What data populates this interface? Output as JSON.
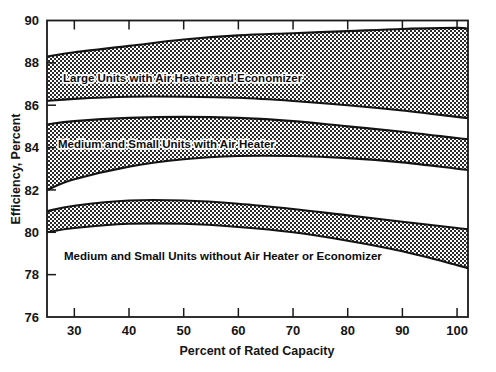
{
  "chart_data": {
    "type": "area",
    "title": "",
    "subtitle": "",
    "xlabel": "Percent of Rated Capacity",
    "ylabel": "Efficiency, Percent",
    "xlim": [
      25,
      102
    ],
    "ylim": [
      76,
      90
    ],
    "xticks": [
      30,
      40,
      50,
      60,
      70,
      80,
      90,
      100
    ],
    "yticks": [
      76,
      78,
      80,
      82,
      84,
      86,
      88,
      90
    ],
    "grid": false,
    "legend_position": "inline-annotations",
    "bands": [
      {
        "name": "Large Units with Air Heater and Economizer",
        "label": "Large Units with Air Heater and Economizer",
        "fill": "stipple-dotted",
        "x": [
          25,
          30,
          40,
          50,
          60,
          70,
          80,
          90,
          100,
          102
        ],
        "upper": [
          88.3,
          88.5,
          88.8,
          89.1,
          89.3,
          89.4,
          89.5,
          89.6,
          89.65,
          89.6
        ],
        "lower": [
          86.2,
          86.3,
          86.4,
          86.4,
          86.35,
          86.2,
          86.0,
          85.75,
          85.45,
          85.4
        ]
      },
      {
        "name": "Medium and Small Units with Air Heater",
        "label": "Medium and Small Units with Air Heater",
        "fill": "stipple-dotted",
        "x": [
          25,
          30,
          40,
          50,
          60,
          70,
          80,
          90,
          100,
          102
        ],
        "upper": [
          85.1,
          85.25,
          85.4,
          85.45,
          85.4,
          85.25,
          85.0,
          84.75,
          84.45,
          84.4
        ],
        "lower": [
          82.0,
          82.5,
          83.1,
          83.45,
          83.6,
          83.6,
          83.5,
          83.3,
          83.0,
          82.95
        ]
      },
      {
        "name": "Medium and Small Units without Air Heater or Economizer",
        "label": "Medium and Small Units without Air Heater or Economizer",
        "fill": "stipple-dotted",
        "x": [
          25,
          30,
          40,
          50,
          60,
          70,
          80,
          90,
          100,
          102
        ],
        "upper": [
          81.0,
          81.25,
          81.5,
          81.5,
          81.35,
          81.1,
          80.8,
          80.5,
          80.2,
          80.15
        ],
        "lower": [
          80.0,
          80.2,
          80.4,
          80.4,
          80.25,
          80.0,
          79.6,
          79.1,
          78.45,
          78.3
        ]
      }
    ]
  },
  "axis": {
    "y_title": "Efficiency, Percent",
    "x_title": "Percent of Rated Capacity",
    "y_tick_labels": [
      "90",
      "88",
      "86",
      "84",
      "82",
      "80",
      "78",
      "76"
    ],
    "x_tick_labels": [
      "30",
      "40",
      "50",
      "60",
      "70",
      "80",
      "90",
      "100"
    ]
  },
  "colors": {
    "frame": "#1a1a1a",
    "text": "#151515",
    "stipple": "#2b2b2b",
    "background": "#ffffff"
  }
}
